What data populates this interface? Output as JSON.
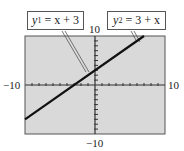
{
  "chart_data": {
    "type": "line",
    "title": "",
    "xlabel": "",
    "ylabel": "",
    "xlim": [
      -10,
      10
    ],
    "ylim": [
      -10,
      10
    ],
    "grid": false,
    "tick_step": 1,
    "tick_labels": {
      "x_min": "−10",
      "x_max": "10",
      "y_min": "−10",
      "y_max": "10"
    },
    "series": [
      {
        "name": "y1 = x + 3",
        "equation": "x + 3",
        "x": [
          -10,
          7
        ],
        "y": [
          -7,
          10
        ]
      },
      {
        "name": "y2 = 3 + x",
        "equation": "3 + x",
        "x": [
          -10,
          7
        ],
        "y": [
          -7,
          10
        ]
      }
    ],
    "annotations": [
      {
        "var": "y",
        "sub": "1",
        "rhs": "= x + 3"
      },
      {
        "var": "y",
        "sub": "2",
        "rhs": "= 3 + x"
      }
    ],
    "colors": {
      "background": "#d9d9d9",
      "frame": "#555555",
      "line": "#111111",
      "axis": "#333333"
    }
  }
}
